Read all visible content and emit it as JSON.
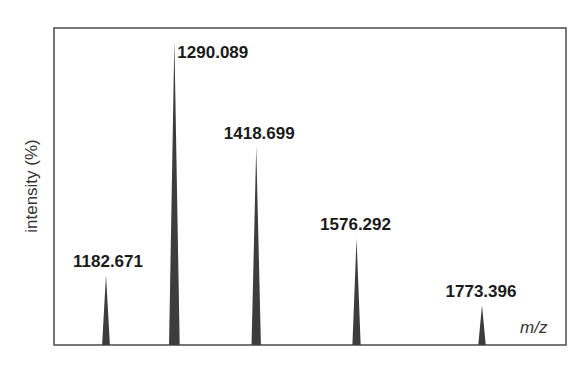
{
  "chart_data": {
    "type": "bar",
    "subtype": "mass-spectrum-stick",
    "title": "",
    "xlabel": "m/z",
    "ylabel": "intensity (%)",
    "ylim": [
      0,
      100
    ],
    "grid": false,
    "legend": null,
    "categories": [
      "1182.671",
      "1290.089",
      "1418.699",
      "1576.292",
      "1773.396"
    ],
    "x": [
      1182.671,
      1290.089,
      1418.699,
      1576.292,
      1773.396
    ],
    "values": [
      23,
      100,
      65,
      35,
      13
    ],
    "annotations": [
      {
        "text": "1182.671",
        "x": 1182.671
      },
      {
        "text": "1290.089",
        "x": 1290.089
      },
      {
        "text": "1418.699",
        "x": 1418.699
      },
      {
        "text": "1576.292",
        "x": 1576.292
      },
      {
        "text": "1773.396",
        "x": 1773.396
      }
    ]
  },
  "labels": {
    "y_axis": "intensity (%)",
    "x_axis_m": "m",
    "x_axis_z": "z"
  },
  "peaks": [
    {
      "label": "1182.671"
    },
    {
      "label": "1290.089"
    },
    {
      "label": "1418.699"
    },
    {
      "label": "1576.292"
    },
    {
      "label": "1773.396"
    }
  ]
}
